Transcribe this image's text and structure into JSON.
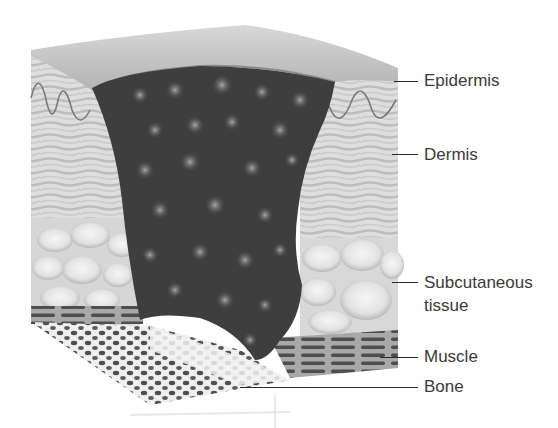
{
  "diagram": {
    "labels": [
      {
        "id": "epidermis",
        "text": "Epidermis"
      },
      {
        "id": "dermis",
        "text": "Dermis"
      },
      {
        "id": "subcutaneous",
        "text": "Subcutaneous",
        "text2": "tissue"
      },
      {
        "id": "muscle",
        "text": "Muscle"
      },
      {
        "id": "bone",
        "text": "Bone"
      }
    ],
    "colors": {
      "wound": "#3d3d3d",
      "wound_spots": "#8a8a8a",
      "skin_surface": "#c8c8c8",
      "dermis": "#d9d9d9",
      "fat": "#e6e6e6",
      "muscle": "#6a6a6a",
      "bone": "#f0f0f0",
      "bone_pores": "#555555",
      "text": "#3a3a3a"
    }
  }
}
